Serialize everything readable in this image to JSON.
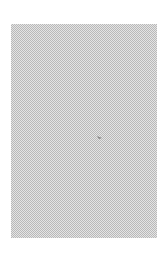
{
  "canvas": {
    "background": "#ffffff",
    "pattern": {
      "type": "checkerboard",
      "light_color": "#e4e4e4",
      "dark_color": "#b9b9b9"
    }
  },
  "cursor": {
    "icon": "pointer-icon",
    "color": "#888888"
  }
}
